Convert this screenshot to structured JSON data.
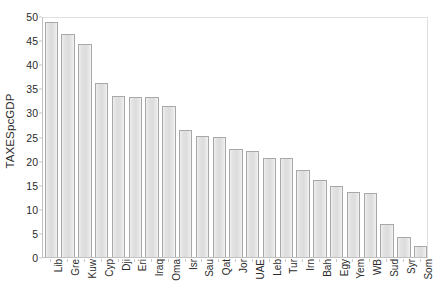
{
  "chart_data": {
    "type": "bar",
    "title": "",
    "xlabel": "",
    "ylabel": "TAXESpcGDP",
    "ylim": [
      0,
      50
    ],
    "ytick_step": 5,
    "yticks": [
      0,
      5,
      10,
      15,
      20,
      25,
      30,
      35,
      40,
      45,
      50
    ],
    "ytick_labels": [
      "0",
      "5",
      "10",
      "15",
      "20",
      "25",
      "30",
      "35",
      "40",
      "45",
      "50"
    ],
    "grid": false,
    "legend": false,
    "legend_position": "none",
    "orientation": "vertical",
    "sorted": "descending",
    "categories": [
      "Lib",
      "Gre",
      "Kuw",
      "Cyp",
      "Dji",
      "Eri",
      "Iraq",
      "Oma",
      "Isr",
      "Sau",
      "Qat",
      "Jor",
      "UAE",
      "Leb",
      "Tur",
      "Irn",
      "Bah",
      "Egy",
      "Yem",
      "WB",
      "Sud",
      "Syr",
      "Som"
    ],
    "values": [
      48.8,
      46.2,
      44.2,
      36.2,
      33.5,
      33.3,
      33.1,
      31.3,
      26.4,
      25.1,
      24.8,
      22.4,
      21.9,
      20.6,
      20.6,
      18.0,
      16.0,
      14.8,
      13.4,
      13.3,
      6.9,
      4.2,
      2.2
    ],
    "series": [
      {
        "name": "TAXESpcGDP",
        "values": [
          48.8,
          46.2,
          44.2,
          36.2,
          33.5,
          33.3,
          33.1,
          31.3,
          26.4,
          25.1,
          24.8,
          22.4,
          21.9,
          20.6,
          20.6,
          18.0,
          16.0,
          14.8,
          13.4,
          13.3,
          6.9,
          4.2,
          2.2
        ]
      }
    ],
    "colors": {
      "bar_fill": "#e2e2e2",
      "bar_border": "#a8a8a8",
      "axis": "#c0c0c0",
      "text": "#2b2b2b",
      "plot_background": "#ffffff"
    }
  }
}
